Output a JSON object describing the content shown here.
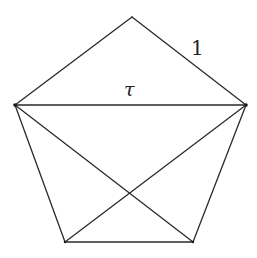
{
  "diagram": {
    "stroke_color": "#2a2a2a",
    "background": "#ffffff",
    "vertices": {
      "top": [
        132,
        17
      ],
      "left": [
        15,
        105
      ],
      "right": [
        246,
        105
      ],
      "bottom_left": [
        65,
        242
      ],
      "bottom_right": [
        193,
        242
      ]
    },
    "labels": {
      "side": "1",
      "diagonal": "τ"
    },
    "edges": [
      {
        "name": "side-top-left",
        "from": "top",
        "to": "left"
      },
      {
        "name": "side-top-right",
        "from": "top",
        "to": "right",
        "label": "1"
      },
      {
        "name": "side-right-bottom-right",
        "from": "right",
        "to": "bottom_right"
      },
      {
        "name": "side-bottom",
        "from": "bottom_right",
        "to": "bottom_left"
      },
      {
        "name": "side-left-bottom-left",
        "from": "bottom_left",
        "to": "left"
      },
      {
        "name": "diagonal-left-right",
        "from": "left",
        "to": "right",
        "label": "τ"
      },
      {
        "name": "diagonal-left-bottom-right",
        "from": "left",
        "to": "bottom_right"
      },
      {
        "name": "diagonal-right-bottom-left",
        "from": "right",
        "to": "bottom_left"
      }
    ]
  }
}
